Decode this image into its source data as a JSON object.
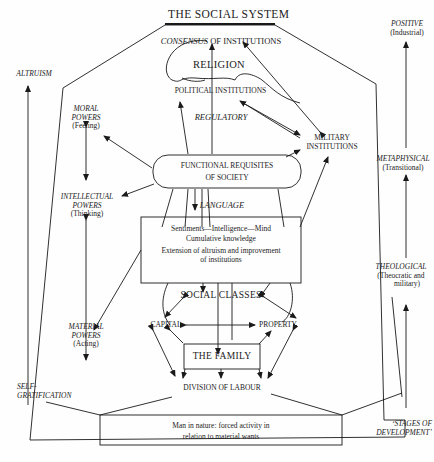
{
  "diagram": {
    "title": "THE SOCIAL SYSTEM",
    "consensus": {
      "italic": "CONSENSUS",
      "rest": " OF INSTITUTIONS"
    },
    "institutions": {
      "religion": "RELIGION",
      "political": "POLITICAL INSTITUTIONS",
      "regulatory": "REGULATORY",
      "military_line1": "MILITARY",
      "military_line2": "INSTITUTIONS"
    },
    "functional_requisites": {
      "line1": "FUNCTIONAL REQUISITES",
      "line2": "OF SOCIETY"
    },
    "language": "LANGUAGE",
    "mind_box": {
      "line1": "Sentiments—Intelligence—Mind",
      "line2": "Cumulative knowledge",
      "line3": "Extension of altruism and improvement",
      "line4": "of institutions"
    },
    "social_classes": "SOCIAL CLASSES",
    "capital": "CAPITAL",
    "property": "PROPERTY",
    "family": "THE FAMILY",
    "division_of_labour": "DIVISION OF LABOUR",
    "nature_box": {
      "line1": "Man in nature: forced activity in",
      "line2": "relation to material wants"
    },
    "powers": {
      "moral": {
        "line1": "MORAL",
        "line2": "POWERS",
        "sub": "(Feeling)"
      },
      "intellectual": {
        "line1": "INTELLECTUAL",
        "line2": "POWERS",
        "sub": "(Thinking)"
      },
      "material": {
        "line1": "MATERIAL",
        "line2": "POWERS",
        "sub": "(Acting)"
      }
    },
    "left_axis": {
      "top": "ALTRUISM",
      "bottom_line1": "SELF-",
      "bottom_line2": "GRATIFICATION"
    },
    "stages": {
      "positive": {
        "label": "POSITIVE",
        "sub": "(Industrial)"
      },
      "metaphysical": {
        "label": "METAPHYSICAL",
        "sub": "(Transitional)"
      },
      "theological": {
        "label": "THEOLOGICAL",
        "sub1": "(Theocratic and",
        "sub2": "military)"
      },
      "caption_line1": "‘STAGES OF",
      "caption_line2": "DEVELOPMENT’"
    },
    "colors": {
      "ink": "#1a1a1a",
      "paper": "#fefefe"
    }
  }
}
